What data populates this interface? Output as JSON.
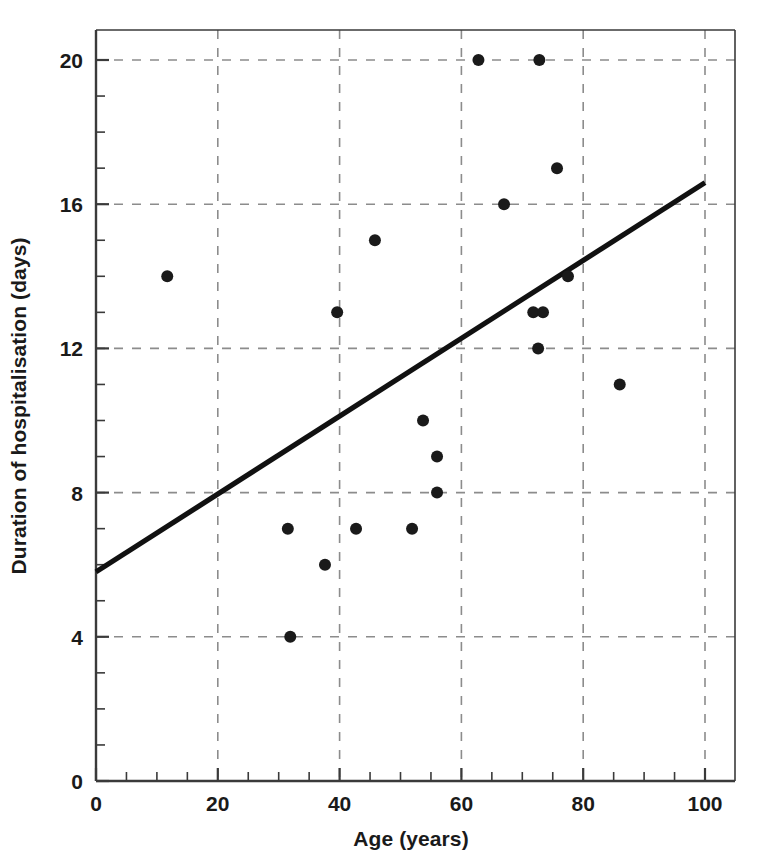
{
  "chart_data": {
    "type": "scatter",
    "title": "",
    "xlabel": "Age (years)",
    "ylabel": "Duration of hospitalisation (days)",
    "xlim": [
      0,
      100
    ],
    "ylim": [
      0,
      21
    ],
    "x_ticks": [
      0,
      20,
      40,
      60,
      80,
      100
    ],
    "x_tick_labels": [
      "0",
      "20",
      "40",
      "60",
      "80",
      "100"
    ],
    "x_minor_step": 5,
    "y_ticks": [
      0,
      4,
      8,
      12,
      16,
      20
    ],
    "y_tick_labels": [
      "0",
      "4",
      "8",
      "12",
      "16",
      "20"
    ],
    "y_minor_step": 1,
    "grid": "dashed-major-both",
    "legend": "none",
    "marker": {
      "shape": "circle",
      "color": "#1a1a1a",
      "size": 11
    },
    "points": [
      {
        "x": 11.7,
        "y": 14
      },
      {
        "x": 31.5,
        "y": 7
      },
      {
        "x": 31.9,
        "y": 4
      },
      {
        "x": 37.6,
        "y": 6
      },
      {
        "x": 39.6,
        "y": 13
      },
      {
        "x": 42.7,
        "y": 7
      },
      {
        "x": 45.8,
        "y": 15
      },
      {
        "x": 51.9,
        "y": 7
      },
      {
        "x": 53.7,
        "y": 10
      },
      {
        "x": 56.0,
        "y": 9
      },
      {
        "x": 56.0,
        "y": 8
      },
      {
        "x": 62.8,
        "y": 20
      },
      {
        "x": 67.0,
        "y": 16
      },
      {
        "x": 71.8,
        "y": 13
      },
      {
        "x": 72.6,
        "y": 12
      },
      {
        "x": 72.8,
        "y": 20
      },
      {
        "x": 73.4,
        "y": 13
      },
      {
        "x": 75.7,
        "y": 17
      },
      {
        "x": 77.5,
        "y": 14
      },
      {
        "x": 86.0,
        "y": 11
      }
    ],
    "trendline": {
      "type": "linear-fit",
      "x_start": 0,
      "y_start": 5.8,
      "x_end": 100,
      "y_end": 16.6,
      "color": "#111111"
    }
  },
  "colors": {
    "axis": "#3a3a3a",
    "grid": "#8c8c8c",
    "marker": "#1a1a1a",
    "trendline": "#111111",
    "background": "#ffffff"
  }
}
